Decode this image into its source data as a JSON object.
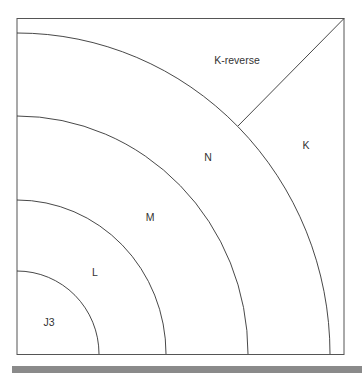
{
  "diagram": {
    "title": "",
    "regions": [
      {
        "id": "j3",
        "label": "J3",
        "x": 49,
        "y": 322
      },
      {
        "id": "l",
        "label": "L",
        "x": 95,
        "y": 272
      },
      {
        "id": "m",
        "label": "M",
        "x": 150,
        "y": 217
      },
      {
        "id": "n",
        "label": "N",
        "x": 208,
        "y": 157
      },
      {
        "id": "k",
        "label": "K",
        "x": 306,
        "y": 145
      },
      {
        "id": "k-reverse",
        "label": "K-reverse",
        "x": 237,
        "y": 60
      }
    ],
    "colors": {
      "line": "#333333",
      "frame": "#555555",
      "bar": "#8a8a8a"
    }
  }
}
